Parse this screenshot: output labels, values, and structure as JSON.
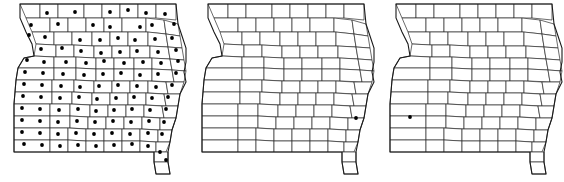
{
  "figure": {
    "type": "multi-panel-choropleth-dot-map",
    "background_color": "#ffffff",
    "outline_color": "#1a1a1a",
    "county_line_color": "#2b2b2b",
    "dot_color": "#000000",
    "panel_count": 3,
    "region_name": "Missouri",
    "caption": "",
    "caption_visible": false
  },
  "panels": [
    {
      "id": "panel-left",
      "position_index": 1,
      "x": 0,
      "dot_count": 103,
      "dot_coverage": "statewide",
      "dots": [
        [
          47,
          13
        ],
        [
          75,
          12
        ],
        [
          110,
          12
        ],
        [
          128,
          10
        ],
        [
          146,
          13
        ],
        [
          165,
          14
        ],
        [
          31,
          25
        ],
        [
          58,
          24
        ],
        [
          93,
          25
        ],
        [
          110,
          27
        ],
        [
          140,
          27
        ],
        [
          152,
          25
        ],
        [
          174,
          24
        ],
        [
          29,
          35
        ],
        [
          45,
          37
        ],
        [
          80,
          40
        ],
        [
          100,
          40
        ],
        [
          118,
          38
        ],
        [
          135,
          40
        ],
        [
          155,
          39
        ],
        [
          172,
          38
        ],
        [
          41,
          49
        ],
        [
          62,
          48
        ],
        [
          81,
          51
        ],
        [
          101,
          53
        ],
        [
          120,
          52
        ],
        [
          137,
          51
        ],
        [
          158,
          52
        ],
        [
          176,
          50
        ],
        [
          27,
          60
        ],
        [
          44,
          62
        ],
        [
          66,
          62
        ],
        [
          86,
          63
        ],
        [
          104,
          61
        ],
        [
          124,
          63
        ],
        [
          143,
          62
        ],
        [
          161,
          63
        ],
        [
          178,
          61
        ],
        [
          25,
          72
        ],
        [
          43,
          73
        ],
        [
          63,
          74
        ],
        [
          84,
          75
        ],
        [
          103,
          74
        ],
        [
          121,
          73
        ],
        [
          140,
          75
        ],
        [
          158,
          74
        ],
        [
          176,
          73
        ],
        [
          24,
          84
        ],
        [
          42,
          85
        ],
        [
          61,
          86
        ],
        [
          80,
          87
        ],
        [
          99,
          86
        ],
        [
          118,
          85
        ],
        [
          137,
          86
        ],
        [
          156,
          87
        ],
        [
          172,
          85
        ],
        [
          23,
          96
        ],
        [
          41,
          97
        ],
        [
          60,
          98
        ],
        [
          79,
          97
        ],
        [
          97,
          99
        ],
        [
          116,
          98
        ],
        [
          134,
          97
        ],
        [
          152,
          98
        ],
        [
          168,
          97
        ],
        [
          22,
          108
        ],
        [
          40,
          109
        ],
        [
          59,
          110
        ],
        [
          78,
          109
        ],
        [
          96,
          111
        ],
        [
          114,
          110
        ],
        [
          132,
          109
        ],
        [
          150,
          110
        ],
        [
          166,
          109
        ],
        [
          22,
          120
        ],
        [
          40,
          121
        ],
        [
          58,
          122
        ],
        [
          77,
          121
        ],
        [
          95,
          122
        ],
        [
          113,
          121
        ],
        [
          131,
          122
        ],
        [
          149,
          121
        ],
        [
          164,
          122
        ],
        [
          22,
          132
        ],
        [
          40,
          133
        ],
        [
          58,
          134
        ],
        [
          76,
          133
        ],
        [
          94,
          134
        ],
        [
          112,
          133
        ],
        [
          130,
          134
        ],
        [
          148,
          133
        ],
        [
          162,
          134
        ],
        [
          24,
          144
        ],
        [
          42,
          145
        ],
        [
          60,
          146
        ],
        [
          78,
          145
        ],
        [
          96,
          146
        ],
        [
          114,
          145
        ],
        [
          132,
          144
        ],
        [
          148,
          146
        ],
        [
          160,
          152
        ],
        [
          166,
          160
        ]
      ]
    },
    {
      "id": "panel-middle",
      "position_index": 2,
      "x": 188,
      "dot_count": 1,
      "dot_coverage": "single-county-southeast",
      "dots": [
        [
          356,
          118
        ]
      ]
    },
    {
      "id": "panel-right",
      "position_index": 3,
      "x": 376,
      "dot_count": 1,
      "dot_coverage": "single-county-west-central",
      "dots": [
        [
          410,
          117
        ]
      ]
    }
  ]
}
